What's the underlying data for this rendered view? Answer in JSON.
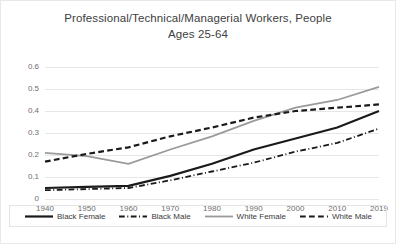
{
  "chart_data": {
    "type": "line",
    "title": "Professional/Technical/Managerial Workers, People Ages 25-64",
    "title_lines": [
      "Professional/Technical/Managerial Workers, People",
      "Ages 25-64"
    ],
    "xlabel": "",
    "ylabel": "",
    "x": [
      1940,
      1950,
      1960,
      1970,
      1980,
      1990,
      2000,
      2010,
      2019
    ],
    "xtick_labels": [
      "1940",
      "1950",
      "1960",
      "1970",
      "1980",
      "1990",
      "2000",
      "2010",
      "2019"
    ],
    "ytick_labels": [
      "0",
      "0.1",
      "0.2",
      "0.3",
      "0.4",
      "0.5",
      "0.6"
    ],
    "yticks": [
      0,
      0.1,
      0.2,
      0.3,
      0.4,
      0.5,
      0.6
    ],
    "ylim": [
      0,
      0.6
    ],
    "grid": true,
    "grid_axis": "y",
    "legend_position": "bottom",
    "series": [
      {
        "name": "Black Female",
        "style": "solid",
        "color": "#1a1a1a",
        "width": 2.2,
        "values": [
          0.05,
          0.055,
          0.06,
          0.105,
          0.16,
          0.225,
          0.275,
          0.325,
          0.4
        ]
      },
      {
        "name": "Black Male",
        "style": "dashdot",
        "color": "#1a1a1a",
        "width": 1.8,
        "values": [
          0.04,
          0.045,
          0.05,
          0.085,
          0.125,
          0.165,
          0.215,
          0.255,
          0.32
        ]
      },
      {
        "name": "White Female",
        "style": "solid",
        "color": "#9a9a9a",
        "width": 1.8,
        "values": [
          0.21,
          0.195,
          0.16,
          0.225,
          0.285,
          0.355,
          0.415,
          0.45,
          0.51
        ]
      },
      {
        "name": "White Male",
        "style": "dashed",
        "color": "#1a1a1a",
        "width": 2.2,
        "values": [
          0.17,
          0.205,
          0.235,
          0.285,
          0.325,
          0.37,
          0.4,
          0.415,
          0.43
        ]
      }
    ]
  },
  "legend": {
    "items": [
      {
        "label": "Black Female"
      },
      {
        "label": "Black Male"
      },
      {
        "label": "White Female"
      },
      {
        "label": "White Male"
      }
    ]
  },
  "colors": {
    "grid": "#e6e6e6",
    "axis_text": "#6e6e6e",
    "title_text": "#404040",
    "border": "#e8e8e8",
    "black_series": "#1a1a1a",
    "gray_series": "#9a9a9a"
  }
}
